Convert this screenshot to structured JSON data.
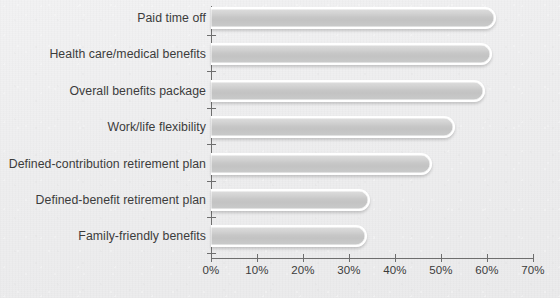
{
  "chart_data": {
    "type": "bar",
    "orientation": "horizontal",
    "title": "",
    "subtitle": "",
    "xlabel": "",
    "ylabel": "",
    "xlim": [
      0,
      70
    ],
    "grid": false,
    "legend": null,
    "xtick_labels": [
      "0%",
      "10%",
      "20%",
      "30%",
      "40%",
      "50%",
      "60%",
      "70%"
    ],
    "xtick_values": [
      0,
      10,
      20,
      30,
      40,
      50,
      60,
      70
    ],
    "categories": [
      "Paid time off",
      "Health care/medical benefits",
      "Overall benefits package",
      "Work/life flexibility",
      "Defined-contribution retirement plan",
      "Defined-benefit retirement plan",
      "Family-friendly benefits"
    ],
    "values": [
      62,
      61,
      59.5,
      53,
      48,
      34.5,
      34
    ],
    "value_unit": "%",
    "bar_color": "#c8c8c8",
    "bar_border_color": "#ffffff",
    "axis_color": "#6e6e6e",
    "label_color": "#3c3c3c",
    "background_color": "#efeff0"
  }
}
